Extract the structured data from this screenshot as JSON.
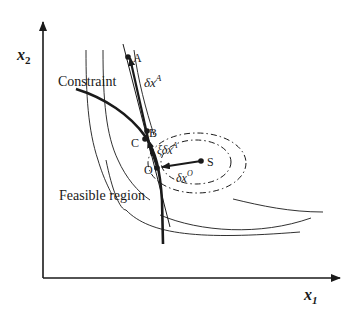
{
  "figure": {
    "axes": {
      "x_label": "x",
      "x_sub": "1",
      "y_label": "x",
      "y_sub": "2"
    },
    "labels": {
      "constraint": "Constraint",
      "feasible_region": "Feasible region",
      "point_a": "A",
      "point_b": "B",
      "point_c": "C",
      "point_o": "O",
      "point_s": "S",
      "delta_xa": "δx",
      "delta_xa_sup": "A",
      "xi_delta_xa": "ξδx",
      "xi_delta_xa_sup": "A",
      "delta_xo": "δx",
      "delta_xo_sup": "O"
    },
    "colors": {
      "stroke": "#1a1a1a",
      "background": "#ffffff"
    }
  }
}
